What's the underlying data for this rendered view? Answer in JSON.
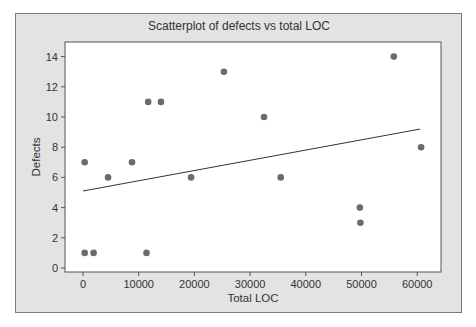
{
  "chart_data": {
    "type": "scatter",
    "title": "Scatterplot of  defects vs total LOC",
    "xlabel": "Total LOC",
    "ylabel": "Defects",
    "xlim": [
      -4500,
      63500
    ],
    "ylim": [
      -0.3,
      15
    ],
    "x_ticks": [
      0,
      10000,
      20000,
      30000,
      40000,
      50000,
      60000
    ],
    "x_tick_labels": [
      "0",
      "10000",
      "20000",
      "30000",
      "40000",
      "50000",
      "60000"
    ],
    "y_ticks": [
      0,
      2,
      4,
      6,
      8,
      10,
      12,
      14
    ],
    "y_tick_labels": [
      "0",
      "2",
      "4",
      "6",
      "8",
      "10",
      "12",
      "14"
    ],
    "grid": false,
    "legend": null,
    "series": [
      {
        "name": "Defects",
        "points": [
          {
            "x": 300,
            "y": 7
          },
          {
            "x": 300,
            "y": 1
          },
          {
            "x": 1900,
            "y": 1
          },
          {
            "x": 4500,
            "y": 6
          },
          {
            "x": 8800,
            "y": 7
          },
          {
            "x": 11400,
            "y": 1
          },
          {
            "x": 11700,
            "y": 11
          },
          {
            "x": 14000,
            "y": 11
          },
          {
            "x": 19400,
            "y": 6
          },
          {
            "x": 25300,
            "y": 13
          },
          {
            "x": 32500,
            "y": 10
          },
          {
            "x": 35500,
            "y": 6
          },
          {
            "x": 49700,
            "y": 4
          },
          {
            "x": 49800,
            "y": 3
          },
          {
            "x": 55800,
            "y": 14
          },
          {
            "x": 60700,
            "y": 8
          }
        ],
        "color": "#6b6b6b"
      }
    ],
    "trendline": {
      "x0": 0,
      "y0": 5.1,
      "x1": 60500,
      "y1": 9.2,
      "color": "#333333"
    }
  },
  "colors": {
    "frame_bg": "#e3e3e3",
    "plot_bg": "#ffffff",
    "marker": "#6b6b6b",
    "text": "#333333"
  }
}
